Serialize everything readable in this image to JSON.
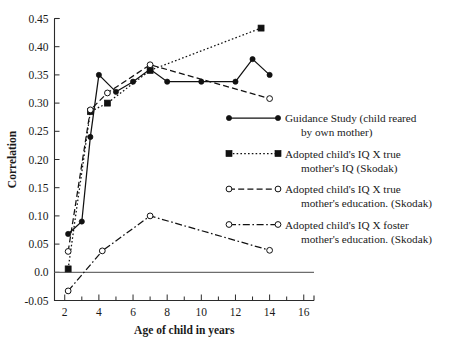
{
  "chart_data": {
    "type": "line",
    "title": "",
    "xlabel": "Age of child in years",
    "ylabel": "Correlation",
    "xlim": [
      1.4,
      16.6
    ],
    "ylim": [
      -0.05,
      0.45
    ],
    "xticks": [
      2,
      4,
      6,
      8,
      10,
      12,
      14,
      16
    ],
    "xticklabels": [
      "2",
      "4",
      "6",
      "8",
      "10",
      "12",
      "14",
      "16"
    ],
    "xminorticks": [
      3,
      5,
      7,
      9,
      11,
      13,
      15
    ],
    "yticks": [
      -0.05,
      0.0,
      0.05,
      0.1,
      0.15,
      0.2,
      0.25,
      0.3,
      0.35,
      0.4,
      0.45
    ],
    "yticklabels": [
      "-0.05",
      "0.0",
      "0.05",
      "0.10",
      "0.15",
      "0.20",
      "0.25",
      "0.30",
      "0.35",
      "0.40",
      "0.45"
    ],
    "grid": false,
    "zero_line": true,
    "legend_position": "right-center",
    "series": [
      {
        "name": "guidance-study",
        "label_line1": "Guidance Study (child reared",
        "label_line2": "by own mother)",
        "marker": "filled-circle",
        "dash": "solid",
        "x": [
          2.2,
          3.0,
          3.5,
          4.0,
          5.0,
          6.0,
          7.0,
          8.0,
          10.0,
          12.0,
          13.0,
          14.0
        ],
        "y": [
          0.068,
          0.09,
          0.24,
          0.35,
          0.32,
          0.338,
          0.36,
          0.338,
          0.338,
          0.338,
          0.378,
          0.35
        ]
      },
      {
        "name": "adopted-true-mother-iq",
        "label_line1": "Adopted child's IQ X true",
        "label_line2": "mother's IQ (Skodak)",
        "marker": "filled-square",
        "dash": "dotted",
        "x": [
          2.2,
          3.5,
          4.5,
          7.0,
          13.5
        ],
        "y": [
          0.006,
          0.285,
          0.3,
          0.358,
          0.433
        ]
      },
      {
        "name": "adopted-true-mother-education",
        "label_line1": "Adopted child's IQ X true",
        "label_line2": "mother's education. (Skodak)",
        "marker": "open-circle",
        "dash": "dashed",
        "x": [
          2.2,
          3.5,
          4.5,
          7.0,
          14.0
        ],
        "y": [
          0.037,
          0.288,
          0.318,
          0.368,
          0.308
        ]
      },
      {
        "name": "adopted-foster-mother-education",
        "label_line1": "Adopted child's IQ X foster",
        "label_line2": "mother's education. (Skodak)",
        "marker": "open-circle",
        "dash": "dashdot",
        "x": [
          2.2,
          4.2,
          7.0,
          14.0
        ],
        "y": [
          -0.033,
          0.038,
          0.1,
          0.039
        ]
      }
    ]
  },
  "legend": {
    "items": [
      {
        "key": "guidance-study",
        "line1": "Guidance Study (child reared",
        "line2": "by own mother)"
      },
      {
        "key": "adopted-true-mother-iq",
        "line1": "Adopted child's IQ X true",
        "line2": "mother's IQ (Skodak)"
      },
      {
        "key": "adopted-true-mother-education",
        "line1": "Adopted child's IQ X true",
        "line2": "mother's education. (Skodak)"
      },
      {
        "key": "adopted-foster-mother-education",
        "line1": "Adopted child's IQ X foster",
        "line2": "mother's education. (Skodak)"
      }
    ]
  },
  "colors": {
    "ink": "#111111",
    "axis": "#2b2b2b",
    "zero_line": "#6d6d6d",
    "background": "#ffffff"
  }
}
